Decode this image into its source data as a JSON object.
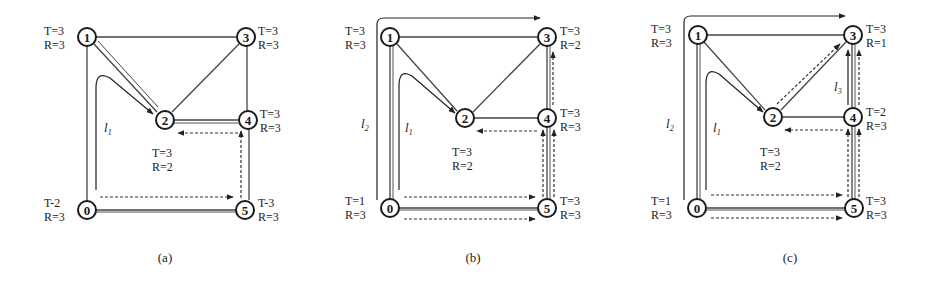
{
  "figure": {
    "panels": [
      {
        "id": "a",
        "caption": "(a)",
        "nodes": [
          {
            "id": "0",
            "label": "0",
            "T": "T-2",
            "R": "R=3"
          },
          {
            "id": "1",
            "label": "1",
            "T": "T=3",
            "R": "R=3"
          },
          {
            "id": "2",
            "label": "2",
            "T": "T=3",
            "R": "R=2"
          },
          {
            "id": "3",
            "label": "3",
            "T": "T=3",
            "R": "R=3"
          },
          {
            "id": "4",
            "label": "4",
            "T": "T=3",
            "R": "R=3"
          },
          {
            "id": "5",
            "label": "5",
            "T": "T-3",
            "R": "R=3"
          }
        ],
        "path_labels": [
          "l1"
        ],
        "path_label_text": {
          "l1": "l",
          "l1_sub": "1"
        }
      },
      {
        "id": "b",
        "caption": "(b)",
        "nodes": [
          {
            "id": "0",
            "label": "0",
            "T": "T=1",
            "R": "R=3"
          },
          {
            "id": "1",
            "label": "1",
            "T": "T=3",
            "R": "R=3"
          },
          {
            "id": "2",
            "label": "2",
            "T": "T=3",
            "R": "R=2"
          },
          {
            "id": "3",
            "label": "3",
            "T": "T=3",
            "R": "R=2"
          },
          {
            "id": "4",
            "label": "4",
            "T": "T=3",
            "R": "R=3"
          },
          {
            "id": "5",
            "label": "5",
            "T": "T=3",
            "R": "R=3"
          }
        ],
        "path_labels": [
          "l1",
          "l2"
        ],
        "path_label_text": {
          "l1": "l",
          "l1_sub": "1",
          "l2": "l",
          "l2_sub": "2"
        }
      },
      {
        "id": "c",
        "caption": "(c)",
        "nodes": [
          {
            "id": "0",
            "label": "0",
            "T": "T=1",
            "R": "R=3"
          },
          {
            "id": "1",
            "label": "1",
            "T": "T=3",
            "R": "R=3"
          },
          {
            "id": "2",
            "label": "2",
            "T": "T=3",
            "R": "R=2"
          },
          {
            "id": "3",
            "label": "3",
            "T": "T=3",
            "R": "R=1"
          },
          {
            "id": "4",
            "label": "4",
            "T": "T=2",
            "R": "R=3"
          },
          {
            "id": "5",
            "label": "5",
            "T": "T=3",
            "R": "R=3"
          }
        ],
        "path_labels": [
          "l1",
          "l2",
          "l3"
        ],
        "path_label_text": {
          "l1": "l",
          "l1_sub": "1",
          "l2": "l",
          "l2_sub": "2",
          "l3": "l",
          "l3_sub": "3"
        }
      }
    ],
    "edges": [
      [
        "0",
        "1"
      ],
      [
        "1",
        "3"
      ],
      [
        "1",
        "2"
      ],
      [
        "2",
        "3"
      ],
      [
        "2",
        "4"
      ],
      [
        "3",
        "4"
      ],
      [
        "4",
        "5"
      ],
      [
        "0",
        "5"
      ]
    ]
  }
}
